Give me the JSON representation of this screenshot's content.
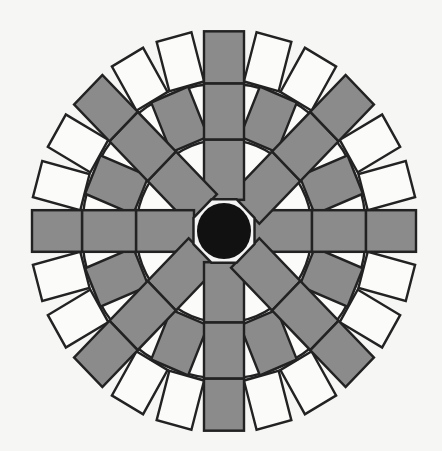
{
  "figure": {
    "title": "",
    "width": 442,
    "height": 451,
    "center": [
      224,
      231
    ],
    "y_scale": 1.04,
    "colors": {
      "background": "#f6f6f4",
      "gray_fill": "#8b8b8b",
      "white_fill": "#fbfbfa",
      "stroke": "#222222",
      "hub_fill": "#111111",
      "hub_ring": "#f4f4f4"
    },
    "stroke_width": 2.4,
    "arms": {
      "count": 8,
      "start_angle_deg": 0,
      "step_deg": 45,
      "half_width": 20,
      "blocks": [
        {
          "r0": 30,
          "r1": 88,
          "fill": "gray"
        },
        {
          "r0": 88,
          "r1": 142,
          "fill": "gray"
        },
        {
          "r0": 142,
          "r1": 192,
          "fill": "gray"
        }
      ]
    },
    "middle_ring_rects": {
      "offsets_deg": [
        22.5
      ],
      "r0": 90,
      "r1": 142,
      "half_width": 20,
      "fill": "gray"
    },
    "outer_ring_rects": {
      "offsets_deg": [
        15,
        30
      ],
      "r0": 144,
      "r1": 193,
      "half_width": 18,
      "fill": "white"
    },
    "ring_arcs": [
      88,
      142
    ],
    "hub": {
      "octagon_radius": 33,
      "circle_radius": 27
    }
  }
}
